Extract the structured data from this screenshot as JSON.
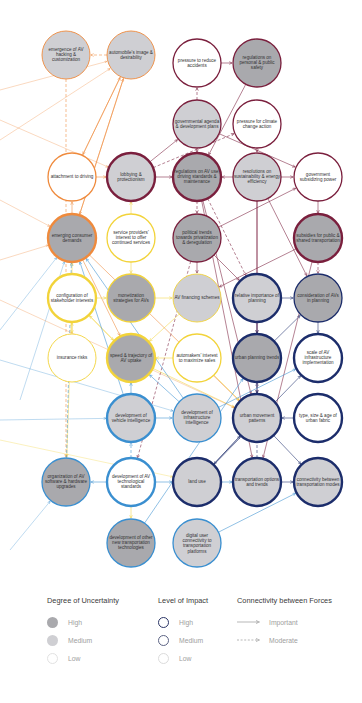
{
  "colors": {
    "social": "#ef8a3c",
    "political": "#7a1f3d",
    "economic": "#f2d33a",
    "technological": "#3a8fd0",
    "urban": "#1c2d6b",
    "fill_high": "#a9a9ad",
    "fill_medium": "#cfcfd3",
    "fill_low": "#ffffff"
  },
  "nodes": [
    {
      "id": "hacking",
      "label": "emergence of AV hacking & customization",
      "x": 66,
      "y": 55,
      "group": "social",
      "uncertainty": "medium",
      "impact": "low"
    },
    {
      "id": "image",
      "label": "automobile's image & desirability",
      "x": 131,
      "y": 55,
      "group": "social",
      "uncertainty": "medium",
      "impact": "low"
    },
    {
      "id": "accidents",
      "label": "pressure to reduce accidents",
      "x": 197,
      "y": 63,
      "group": "political",
      "uncertainty": "low",
      "impact": "medium"
    },
    {
      "id": "safety",
      "label": "regulations on personal & public safety",
      "x": 257,
      "y": 63,
      "group": "political",
      "uncertainty": "high",
      "impact": "medium"
    },
    {
      "id": "agenda",
      "label": "governmental agenda & development plans",
      "x": 197,
      "y": 124,
      "group": "political",
      "uncertainty": "medium",
      "impact": "medium"
    },
    {
      "id": "climate",
      "label": "pressure for climate change action",
      "x": 257,
      "y": 124,
      "group": "political",
      "uncertainty": "low",
      "impact": "medium"
    },
    {
      "id": "attachment",
      "label": "attachment to driving",
      "x": 72,
      "y": 177,
      "group": "social",
      "uncertainty": "low",
      "impact": "medium"
    },
    {
      "id": "lobbying",
      "label": "lobbying & protectionism",
      "x": 131,
      "y": 177,
      "group": "political",
      "uncertainty": "medium",
      "impact": "high"
    },
    {
      "id": "avuse",
      "label": "regulations on AV use, driving standards & maintenance",
      "x": 197,
      "y": 177,
      "group": "political",
      "uncertainty": "high",
      "impact": "high"
    },
    {
      "id": "sustain",
      "label": "resolutions on sustainability & energy efficiency",
      "x": 257,
      "y": 177,
      "group": "political",
      "uncertainty": "medium",
      "impact": "medium"
    },
    {
      "id": "subsidizing",
      "label": "government subsidizing power",
      "x": 318,
      "y": 177,
      "group": "political",
      "uncertainty": "low",
      "impact": "medium"
    },
    {
      "id": "consumer",
      "label": "emerging consumer demands",
      "x": 72,
      "y": 238,
      "group": "social",
      "uncertainty": "high",
      "impact": "high"
    },
    {
      "id": "service",
      "label": "service providers' interest to offer continued services",
      "x": 131,
      "y": 238,
      "group": "economic",
      "uncertainty": "low",
      "impact": "medium"
    },
    {
      "id": "political",
      "label": "political trends towards privatization & deregulation",
      "x": 197,
      "y": 238,
      "group": "political",
      "uncertainty": "high",
      "impact": "medium"
    },
    {
      "id": "subsidies",
      "label": "subsidies for public & shared transportation",
      "x": 318,
      "y": 238,
      "group": "political",
      "uncertainty": "high",
      "impact": "high"
    },
    {
      "id": "config",
      "label": "configuration of stakeholder interests",
      "x": 72,
      "y": 298,
      "group": "economic",
      "uncertainty": "low",
      "impact": "high"
    },
    {
      "id": "monetization",
      "label": "monetization strategies for AVs",
      "x": 131,
      "y": 298,
      "group": "economic",
      "uncertainty": "high",
      "impact": "medium"
    },
    {
      "id": "financing",
      "label": "AV financing schemes",
      "x": 197,
      "y": 298,
      "group": "economic",
      "uncertainty": "medium",
      "impact": "low"
    },
    {
      "id": "relative",
      "label": "relative importance of planning",
      "x": 257,
      "y": 298,
      "group": "urban",
      "uncertainty": "medium",
      "impact": "high"
    },
    {
      "id": "consideration",
      "label": "consideration of AVs in planning",
      "x": 318,
      "y": 298,
      "group": "urban",
      "uncertainty": "high",
      "impact": "medium"
    },
    {
      "id": "insurance",
      "label": "insurance risks",
      "x": 72,
      "y": 358,
      "group": "economic",
      "uncertainty": "low",
      "impact": "low"
    },
    {
      "id": "speed",
      "label": "speed & trajectory of AV uptake",
      "x": 131,
      "y": 358,
      "group": "economic",
      "uncertainty": "high",
      "impact": "high"
    },
    {
      "id": "automakers",
      "label": "automakers' interest to maximize sales",
      "x": 197,
      "y": 358,
      "group": "economic",
      "uncertainty": "low",
      "impact": "medium"
    },
    {
      "id": "planning",
      "label": "urban planning trends",
      "x": 257,
      "y": 358,
      "group": "urban",
      "uncertainty": "high",
      "impact": "high"
    },
    {
      "id": "scale",
      "label": "scale of AV infrastructure implementation",
      "x": 318,
      "y": 358,
      "group": "urban",
      "uncertainty": "low",
      "impact": "high"
    },
    {
      "id": "vehicle",
      "label": "development of vehicle intelligence",
      "x": 131,
      "y": 418,
      "group": "technological",
      "uncertainty": "medium",
      "impact": "high"
    },
    {
      "id": "infra",
      "label": "development of infrastructure intelligence",
      "x": 197,
      "y": 418,
      "group": "technological",
      "uncertainty": "medium",
      "impact": "medium"
    },
    {
      "id": "movement",
      "label": "urban movement patterns",
      "x": 257,
      "y": 418,
      "group": "urban",
      "uncertainty": "medium",
      "impact": "high"
    },
    {
      "id": "fabric",
      "label": "type, size & age of urban fabric",
      "x": 318,
      "y": 418,
      "group": "urban",
      "uncertainty": "low",
      "impact": "high"
    },
    {
      "id": "software",
      "label": "organization of AV software & hardware upgrades",
      "x": 66,
      "y": 482,
      "group": "technological",
      "uncertainty": "high",
      "impact": "medium"
    },
    {
      "id": "standards",
      "label": "development of AV technological standards",
      "x": 131,
      "y": 482,
      "group": "technological",
      "uncertainty": "low",
      "impact": "high"
    },
    {
      "id": "landuse",
      "label": "land use",
      "x": 197,
      "y": 482,
      "group": "urban",
      "uncertainty": "medium",
      "impact": "high"
    },
    {
      "id": "options",
      "label": "transportation options and trends",
      "x": 257,
      "y": 482,
      "group": "urban",
      "uncertainty": "medium",
      "impact": "high"
    },
    {
      "id": "connectivity",
      "label": "connectivity between transportation modes",
      "x": 318,
      "y": 482,
      "group": "urban",
      "uncertainty": "medium",
      "impact": "high"
    },
    {
      "id": "tools",
      "label": "development of other new transportation technologies",
      "x": 131,
      "y": 543,
      "group": "technological",
      "uncertainty": "high",
      "impact": "medium"
    },
    {
      "id": "digital",
      "label": "digital user connectivity to transportation platforms",
      "x": 197,
      "y": 543,
      "group": "technological",
      "uncertainty": "medium",
      "impact": "medium"
    }
  ],
  "edges": [
    [
      "image",
      "hacking",
      "social",
      true
    ],
    [
      "attachment",
      "image",
      "social",
      false
    ],
    [
      "consumer",
      "image",
      "social",
      false
    ],
    [
      "attachment",
      "lobbying",
      "social",
      false
    ],
    [
      "consumer",
      "attachment",
      "social",
      false
    ],
    [
      "image",
      "attachment",
      "social",
      false
    ],
    [
      "image",
      "consumer",
      "social",
      false
    ],
    [
      "consumer",
      "speed",
      "social",
      false
    ],
    [
      "consumer",
      "movement",
      "social",
      false
    ],
    [
      "hacking",
      "software",
      "social",
      true
    ],
    [
      "accidents",
      "safety",
      "political",
      false
    ],
    [
      "agenda",
      "accidents",
      "political",
      true
    ],
    [
      "agenda",
      "avuse",
      "political",
      false
    ],
    [
      "agenda",
      "subsidizing",
      "political",
      false
    ],
    [
      "climate",
      "sustain",
      "political",
      false
    ],
    [
      "safety",
      "avuse",
      "political",
      false
    ],
    [
      "lobbying",
      "avuse",
      "political",
      false
    ],
    [
      "lobbying",
      "agenda",
      "political",
      false
    ],
    [
      "lobbying",
      "climate",
      "political",
      true
    ],
    [
      "sustain",
      "avuse",
      "political",
      false
    ],
    [
      "sustain",
      "subsidizing",
      "political",
      false
    ],
    [
      "sustain",
      "planning",
      "political",
      false
    ],
    [
      "sustain",
      "movement",
      "political",
      false
    ],
    [
      "subsidizing",
      "subsidies",
      "political",
      false
    ],
    [
      "avuse",
      "political",
      "political",
      true
    ],
    [
      "avuse",
      "movement",
      "political",
      false
    ],
    [
      "avuse",
      "relative",
      "political",
      true
    ],
    [
      "political",
      "subsidizing",
      "political",
      false
    ],
    [
      "political",
      "financing",
      "political",
      false
    ],
    [
      "political",
      "relative",
      "political",
      false
    ],
    [
      "subsidies",
      "financing",
      "political",
      false
    ],
    [
      "subsidies",
      "consideration",
      "political",
      true
    ],
    [
      "subsidies",
      "options",
      "political",
      false
    ],
    [
      "sustain",
      "consideration",
      "political",
      false
    ],
    [
      "avuse",
      "options",
      "political",
      false
    ],
    [
      "political",
      "standards",
      "political",
      true
    ],
    [
      "service",
      "monetization",
      "economic",
      false
    ],
    [
      "service",
      "lobbying",
      "economic",
      false
    ],
    [
      "monetization",
      "financing",
      "economic",
      false
    ],
    [
      "config",
      "monetization",
      "economic",
      false
    ],
    [
      "config",
      "insurance",
      "economic",
      false
    ],
    [
      "config",
      "speed",
      "economic",
      false
    ],
    [
      "config",
      "consumer",
      "economic",
      false
    ],
    [
      "insurance",
      "config",
      "economic",
      false
    ],
    [
      "speed",
      "config",
      "economic",
      false
    ],
    [
      "automakers",
      "speed",
      "economic",
      false
    ],
    [
      "automakers",
      "movement",
      "economic",
      false
    ],
    [
      "speed",
      "movement",
      "economic",
      false
    ],
    [
      "standards",
      "tools",
      "economic",
      false
    ],
    [
      "config",
      "software",
      "economic",
      false
    ],
    [
      "financing",
      "speed",
      "economic",
      false
    ],
    [
      "relative",
      "consideration",
      "urban",
      false
    ],
    [
      "consideration",
      "scale",
      "urban",
      false
    ],
    [
      "planning",
      "movement",
      "urban",
      false
    ],
    [
      "planning",
      "consideration",
      "urban",
      false
    ],
    [
      "fabric",
      "movement",
      "urban",
      false
    ],
    [
      "movement",
      "landuse",
      "urban",
      false
    ],
    [
      "movement",
      "connectivity",
      "urban",
      false
    ],
    [
      "options",
      "connectivity",
      "urban",
      false
    ],
    [
      "landuse",
      "movement",
      "urban",
      false
    ],
    [
      "relative",
      "planning",
      "urban",
      false
    ],
    [
      "options",
      "planning",
      "urban",
      true
    ],
    [
      "landuse",
      "scale",
      "urban",
      false
    ],
    [
      "vehicle",
      "speed",
      "technological",
      false
    ],
    [
      "vehicle",
      "infra",
      "technological",
      false
    ],
    [
      "infra",
      "speed",
      "technological",
      false
    ],
    [
      "infra",
      "scale",
      "technological",
      false
    ],
    [
      "standards",
      "software",
      "technological",
      false
    ],
    [
      "standards",
      "vehicle",
      "technological",
      true
    ],
    [
      "tools",
      "planning",
      "technological",
      false
    ],
    [
      "digital",
      "connectivity",
      "technological",
      false
    ],
    [
      "software",
      "consumer",
      "technological",
      true
    ],
    [
      "vehicle",
      "consumer",
      "technological",
      false
    ],
    [
      "infra",
      "consumer",
      "technological",
      false
    ],
    [
      "standards",
      "landuse",
      "technological",
      false
    ],
    [
      "landuse",
      "options",
      "technological",
      false
    ]
  ],
  "legend": {
    "uncertainty": {
      "title": "Degree of Uncertainty",
      "items": [
        "High",
        "Medium",
        "Low"
      ]
    },
    "impact": {
      "title": "Level of Impact",
      "items": [
        "High",
        "Medium",
        "Low"
      ]
    },
    "connectivity": {
      "title": "Connectivity between Forces",
      "items": [
        "Important",
        "Moderate"
      ]
    }
  }
}
